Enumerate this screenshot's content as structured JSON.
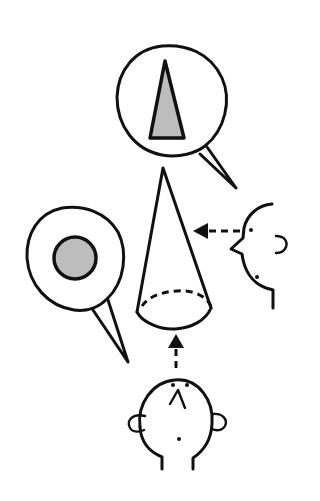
{
  "diagram": {
    "views": [
      {
        "id": "top-view",
        "direction": "from below",
        "shape": "circle",
        "fill": "#bdbdbd"
      },
      {
        "id": "side-view",
        "direction": "from the side",
        "shape": "triangle",
        "fill": "#bdbdbd"
      }
    ],
    "colors": {
      "ink": "#111111",
      "fill": "#bdbdbd",
      "background": "#ffffff"
    }
  }
}
